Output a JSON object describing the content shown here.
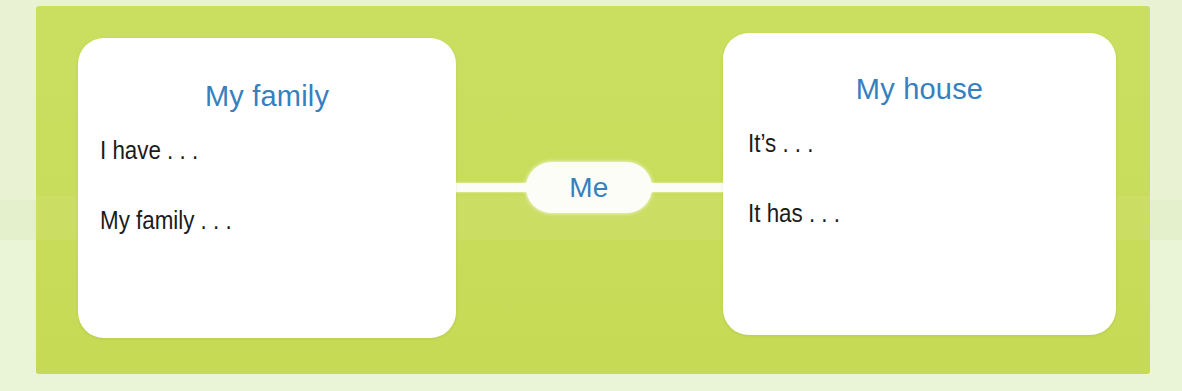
{
  "diagram": {
    "type": "mind-map",
    "center": {
      "label": "Me"
    },
    "branches": [
      {
        "id": "my-family",
        "title": "My family",
        "lines": [
          "I have . . .",
          "My family . . ."
        ]
      },
      {
        "id": "my-house",
        "title": "My house",
        "lines": [
          "It’s . . .",
          "It has . . ."
        ]
      }
    ],
    "colors": {
      "panel_green": "#c9dd5c",
      "page_green": "#e9f3d4",
      "box_white": "#ffffff",
      "title_blue": "#3580bf",
      "body_text": "#1b1b1b"
    }
  }
}
